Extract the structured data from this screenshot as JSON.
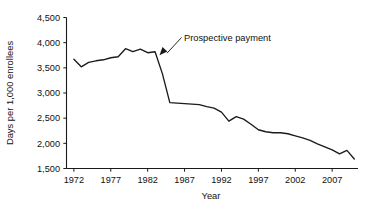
{
  "chart_data": {
    "type": "line",
    "title": "",
    "xlabel": "Year",
    "ylabel": "Days per 1,000 enrollees",
    "xlim": [
      1971,
      2010.5
    ],
    "ylim": [
      1500,
      4500
    ],
    "grid": false,
    "legend": null,
    "x_ticks": [
      1972,
      1977,
      1982,
      1987,
      1992,
      1997,
      2002,
      2007
    ],
    "x_tick_labels": [
      "1972",
      "1977",
      "1982",
      "1987",
      "1992",
      "1997",
      "2002",
      "2007"
    ],
    "y_ticks": [
      1500,
      2000,
      2500,
      3000,
      3500,
      4000,
      4500
    ],
    "y_tick_labels": [
      "1,500",
      "2,000",
      "2,500",
      "3,000",
      "3,500",
      "4,000",
      "4,500"
    ],
    "series": [
      {
        "name": "Hospital days per 1,000 enrollees",
        "color": "#1b1b1b",
        "x": [
          1972,
          1973,
          1974,
          1975,
          1976,
          1977,
          1978,
          1979,
          1980,
          1981,
          1982,
          1983,
          1984,
          1985,
          1986,
          1987,
          1988,
          1989,
          1990,
          1991,
          1992,
          1993,
          1994,
          1995,
          1996,
          1997,
          1998,
          1999,
          2000,
          2001,
          2002,
          2003,
          2004,
          2005,
          2006,
          2007,
          2008,
          2009,
          2010
        ],
        "values": [
          3670,
          3520,
          3610,
          3640,
          3660,
          3700,
          3720,
          3880,
          3820,
          3870,
          3800,
          3820,
          3380,
          2810,
          2800,
          2790,
          2780,
          2770,
          2730,
          2700,
          2620,
          2440,
          2530,
          2480,
          2380,
          2270,
          2230,
          2210,
          2210,
          2190,
          2150,
          2110,
          2060,
          1990,
          1930,
          1870,
          1790,
          1860,
          1690
        ]
      }
    ],
    "annotations": [
      {
        "text": "Prospective payment",
        "target_x": 1983.6,
        "target_y": 3800,
        "note": "arrow points to the onset of the sharp decline"
      }
    ]
  },
  "axis_titles": {
    "x": "Year",
    "y": "Days per 1,000 enrollees"
  }
}
